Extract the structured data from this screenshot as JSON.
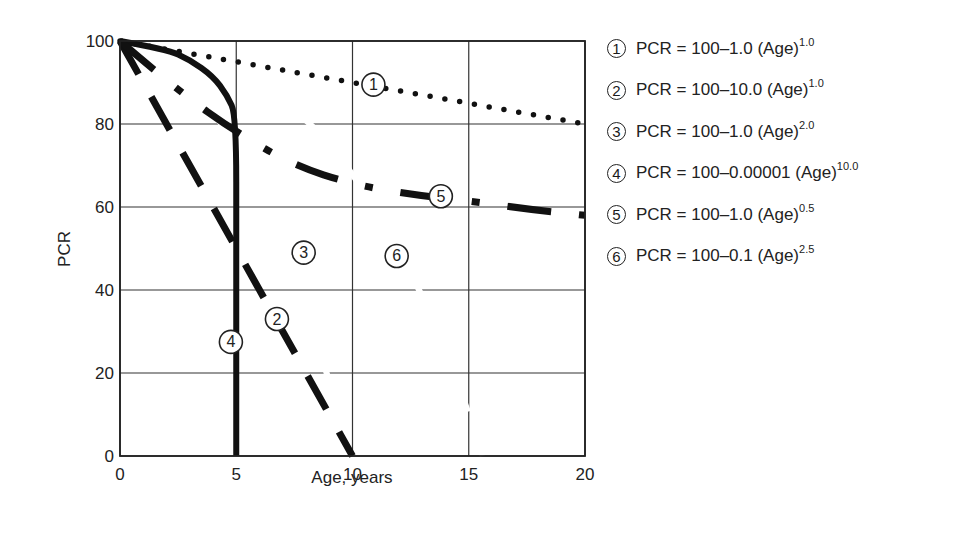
{
  "chart_data": {
    "type": "line",
    "title": "",
    "xlabel": "Age, years",
    "ylabel": "PCR",
    "xlim": [
      0,
      20
    ],
    "ylim": [
      0,
      100
    ],
    "x_ticks": [
      "0",
      "5",
      "10",
      "15",
      "20"
    ],
    "y_ticks": [
      "0",
      "20",
      "40",
      "60",
      "80",
      "100"
    ],
    "grid": true,
    "legend_position": "right",
    "series": [
      {
        "id": "1",
        "name": "PCR = 100–1.0 (Age)^1.0",
        "style": "dotted",
        "x": [
          0,
          5,
          10,
          15,
          20
        ],
        "values": [
          100,
          95,
          90,
          85,
          80
        ]
      },
      {
        "id": "2",
        "name": "PCR = 100–10.0 (Age)^1.0",
        "style": "long-dash",
        "x": [
          0,
          5,
          10
        ],
        "values": [
          100,
          50,
          0
        ]
      },
      {
        "id": "3",
        "name": "PCR = 100–1.0 (Age)^2.0",
        "style": "hidden-white",
        "x": [
          0,
          2,
          4,
          6,
          8,
          10
        ],
        "values": [
          100,
          96,
          84,
          64,
          36,
          0
        ]
      },
      {
        "id": "4",
        "name": "PCR = 100–0.00001 (Age)^10.0",
        "style": "solid",
        "x": [
          0,
          2,
          3,
          4,
          4.6,
          5,
          5,
          5
        ],
        "values": [
          100,
          98,
          95.5,
          91.5,
          87,
          82,
          50,
          0
        ]
      },
      {
        "id": "5",
        "name": "PCR = 100–1.0 (Age)^0.5",
        "style": "dash-dot",
        "x": [
          0,
          2.5,
          5,
          7.5,
          10,
          12.5,
          15,
          17.5,
          20
        ],
        "values": [
          100,
          88,
          78,
          70,
          65.5,
          63,
          61.5,
          59.5,
          58
        ]
      },
      {
        "id": "6",
        "name": "PCR = 100–0.1 (Age)^2.5",
        "style": "hidden-white",
        "x": [
          0,
          4,
          8,
          10,
          12,
          14,
          15.6
        ],
        "values": [
          100,
          96.8,
          81.9,
          68.4,
          50.1,
          26.7,
          0
        ]
      }
    ],
    "annotations": [
      {
        "label": "1",
        "x": 10.9,
        "y": 89.5
      },
      {
        "label": "2",
        "x": 6.75,
        "y": 33
      },
      {
        "label": "3",
        "x": 7.9,
        "y": 49
      },
      {
        "label": "4",
        "x": 4.77,
        "y": 27.5
      },
      {
        "label": "5",
        "x": 13.8,
        "y": 62.6
      },
      {
        "label": "6",
        "x": 11.9,
        "y": 48.2
      }
    ]
  },
  "legend": [
    {
      "num": "1",
      "eq": "PCR = 100–1.0 (Age)",
      "exp": "1.0"
    },
    {
      "num": "2",
      "eq": "PCR = 100–10.0 (Age)",
      "exp": "1.0"
    },
    {
      "num": "3",
      "eq": "PCR = 100–1.0 (Age)",
      "exp": "2.0"
    },
    {
      "num": "4",
      "eq": "PCR = 100–0.00001 (Age)",
      "exp": "10.0"
    },
    {
      "num": "5",
      "eq": "PCR = 100–1.0 (Age)",
      "exp": "0.5"
    },
    {
      "num": "6",
      "eq": "PCR = 100–0.1 (Age)",
      "exp": "2.5"
    }
  ]
}
